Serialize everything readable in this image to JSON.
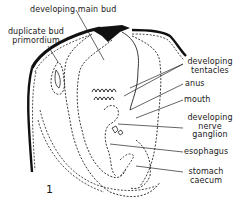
{
  "figure": {
    "number": "1",
    "labels": {
      "main_bud": "developing main bud",
      "duplicate_bud_line1": "duplicate bud",
      "duplicate_bud_line2": "primordium",
      "tentacles_line1": "developing",
      "tentacles_line2": "tentacles",
      "anus": "anus",
      "mouth": "mouth",
      "nerve_line1": "developing",
      "nerve_line2": "nerve",
      "nerve_line3": "ganglion",
      "esophagus": "esophagus",
      "stomach_line1": "stomach",
      "stomach_line2": "caecum"
    }
  }
}
